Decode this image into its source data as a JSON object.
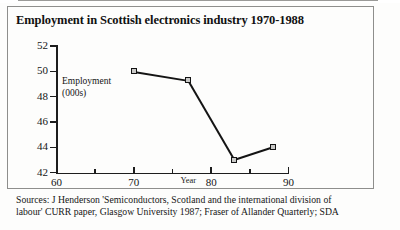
{
  "page": {
    "background": "#fdfdfc",
    "ink": "#141414"
  },
  "chart_frame": {
    "title": "Employment in Scottish electronics industry 1970-1988"
  },
  "series_annotation": {
    "line1": "Employment",
    "line2": "(000s)"
  },
  "sources": {
    "line1": "Sources: J Henderson 'Semiconductors, Scotland and the international division of",
    "line2": "labour' CURR paper, Glasgow University 1987; Fraser of Allander Quarterly; SDA"
  },
  "chart_data": {
    "type": "line",
    "title": "Employment in Scottish electronics industry 1970-1988",
    "xlabel": "Year",
    "ylabel": "Employment (000s)",
    "xlim": [
      60,
      90
    ],
    "ylim": [
      42,
      52
    ],
    "grid": false,
    "legend": "none",
    "marker": "square",
    "x_ticks_major": [
      60,
      70,
      80,
      90
    ],
    "x_ticks_minor": [
      65,
      75,
      85
    ],
    "x_tick_labels": [
      "60",
      "70",
      "80",
      "90"
    ],
    "y_ticks": [
      42,
      44,
      46,
      48,
      50,
      52
    ],
    "y_tick_labels": [
      "42",
      "44",
      "46",
      "48",
      "50",
      "52"
    ],
    "series": [
      {
        "name": "Employment (000s)",
        "color": "#141414",
        "x": [
          70,
          77,
          83,
          88
        ],
        "values": [
          50.0,
          49.3,
          43.0,
          44.0
        ]
      }
    ]
  }
}
